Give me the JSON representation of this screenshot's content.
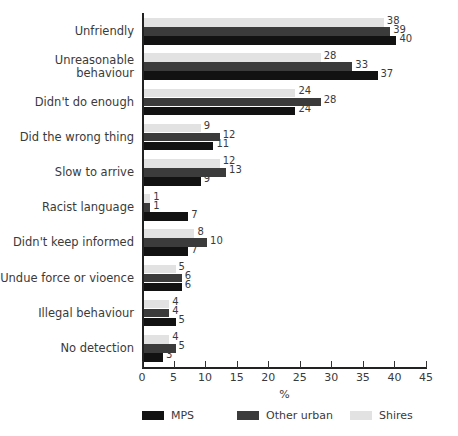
{
  "chart_data": {
    "type": "bar",
    "orientation": "horizontal",
    "title": "",
    "subtitle": "",
    "xlabel": "%",
    "ylabel": "",
    "xlim": [
      0,
      45
    ],
    "xticks": [
      0,
      5,
      10,
      15,
      20,
      25,
      30,
      35,
      40,
      45
    ],
    "xticklabels": [
      "0",
      "5",
      "10",
      "15",
      "20",
      "25",
      "30",
      "35",
      "40",
      "45"
    ],
    "grid": false,
    "legend_position": "bottom",
    "categories": [
      "Unfriendly",
      "Unreasonable behaviour",
      "Didn't do enough",
      "Did the wrong thing",
      "Slow to arrive",
      "Racist language",
      "Didn't keep informed",
      "Undue force or vioence",
      "Illegal behaviour",
      "No detection"
    ],
    "series": [
      {
        "name": "Shires",
        "color": "#e2e2e2",
        "values": [
          38,
          28,
          24,
          9,
          12,
          1,
          8,
          5,
          4,
          4
        ]
      },
      {
        "name": "Other urban",
        "color": "#3b3b3b",
        "values": [
          39,
          33,
          28,
          12,
          13,
          1,
          10,
          6,
          4,
          5
        ]
      },
      {
        "name": "MPS",
        "color": "#121212",
        "values": [
          40,
          37,
          24,
          11,
          9,
          7,
          7,
          6,
          5,
          3
        ]
      }
    ],
    "legend_order": [
      "MPS",
      "Other urban",
      "Shires"
    ]
  },
  "colors": {
    "mps": "#121212",
    "other_urban": "#3b3b3b",
    "shires": "#e2e2e2",
    "axis": "#222222",
    "text": "#3a3a3a",
    "background": "#ffffff"
  }
}
